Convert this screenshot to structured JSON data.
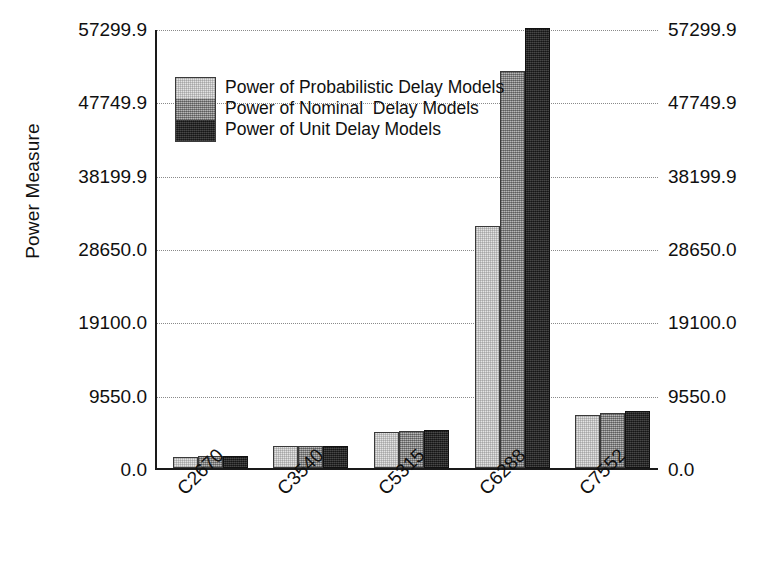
{
  "chart_data": {
    "type": "bar",
    "title": "",
    "xlabel": "",
    "ylabel": "Power Measure",
    "categories": [
      "C2670",
      "C3540",
      "C5315",
      "C6288",
      "C7552"
    ],
    "series": [
      {
        "name": "Power of Probabilistic Delay Models",
        "color": "#e3e3e3",
        "values": [
          1450,
          2860,
          4690,
          31500,
          6900
        ]
      },
      {
        "name": "Power of Nominal  Delay Models",
        "color": "#9b9b9b",
        "values": [
          1520,
          2860,
          4820,
          51700,
          7160
        ]
      },
      {
        "name": "Power of Unit Delay Models",
        "color": "#242424",
        "values": [
          1560,
          2860,
          4950,
          57299.9,
          7420
        ]
      }
    ],
    "ylim": [
      0,
      57299.9
    ],
    "yticks": [
      0,
      9550,
      19100,
      28650,
      38199.9,
      47749.9,
      57299.9
    ],
    "ytick_labels": [
      "0.0",
      "9550.0",
      "19100.0",
      "28650.0",
      "38199.9",
      "47749.9",
      "57299.9"
    ],
    "grid": true,
    "grid_style": "dotted",
    "legend_position": "upper-left-inside",
    "right_axis_mirrors_left": true
  }
}
